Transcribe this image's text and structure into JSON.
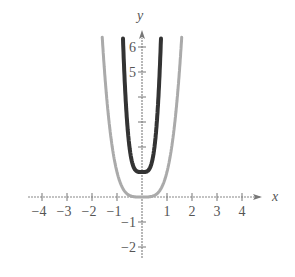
{
  "chart_data": {
    "type": "line",
    "title": "",
    "xlabel": "x",
    "ylabel": "y",
    "xlim": [
      -4.5,
      5
    ],
    "ylim": [
      -2.5,
      6.6
    ],
    "x_ticks": [
      -4,
      -3,
      -2,
      -1,
      1,
      2,
      3,
      4
    ],
    "x_tick_labels": [
      "−4",
      "−3",
      "−2",
      "−1",
      "1",
      "2",
      "3",
      "4"
    ],
    "y_ticks": [
      -2,
      -1,
      1,
      2,
      3,
      4,
      5,
      6
    ],
    "y_tick_labels": [
      "−2",
      "−1",
      "",
      "",
      "",
      "",
      "5",
      "6"
    ],
    "grid": false,
    "series": [
      {
        "name": "y = x^4",
        "color": "#aaaaaa",
        "width": 3,
        "formula": "x^4",
        "x": [
          -1.59,
          -1.5,
          -1.25,
          -1,
          -0.75,
          -0.5,
          0,
          0.5,
          0.75,
          1,
          1.25,
          1.5,
          1.59
        ],
        "y": [
          6.4,
          5.06,
          2.44,
          1,
          0.32,
          0.06,
          0,
          0.06,
          0.32,
          1,
          2.44,
          5.06,
          6.4
        ]
      },
      {
        "name": "y = (2x)^4 + 1",
        "color": "#333333",
        "width": 4,
        "formula": "(2x)^4+1",
        "x": [
          -0.76,
          -0.7,
          -0.6,
          -0.5,
          -0.4,
          -0.25,
          0,
          0.25,
          0.4,
          0.5,
          0.6,
          0.7,
          0.76
        ],
        "y": [
          6.4,
          4.84,
          3.07,
          2,
          1.41,
          1.06,
          1,
          1.06,
          1.41,
          2,
          3.07,
          4.84,
          6.4
        ]
      }
    ]
  }
}
